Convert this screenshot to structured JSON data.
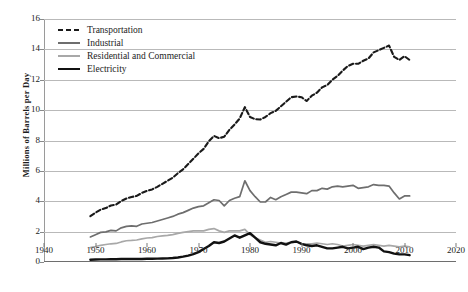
{
  "chart_data": {
    "type": "line",
    "title": "",
    "xlabel": "",
    "ylabel": "Millions of Barrels per Day",
    "xlim": [
      1940,
      2020
    ],
    "ylim": [
      0,
      16
    ],
    "xticks": [
      1940,
      1950,
      1960,
      1970,
      1980,
      1990,
      2000,
      2010,
      2020
    ],
    "yticks": [
      0,
      2,
      4,
      6,
      8,
      10,
      12,
      14,
      16
    ],
    "grid": "horizontal",
    "legend_position": "top-left",
    "x": [
      1949,
      1950,
      1951,
      1952,
      1953,
      1954,
      1955,
      1956,
      1957,
      1958,
      1959,
      1960,
      1961,
      1962,
      1963,
      1964,
      1965,
      1966,
      1967,
      1968,
      1969,
      1970,
      1971,
      1972,
      1973,
      1974,
      1975,
      1976,
      1977,
      1978,
      1979,
      1980,
      1981,
      1982,
      1983,
      1984,
      1985,
      1986,
      1987,
      1988,
      1989,
      1990,
      1991,
      1992,
      1993,
      1994,
      1995,
      1996,
      1997,
      1998,
      1999,
      2000,
      2001,
      2002,
      2003,
      2004,
      2005,
      2006,
      2007,
      2008,
      2009,
      2010,
      2011
    ],
    "series": [
      {
        "name": "Transportation",
        "style": "dashed",
        "color": "#1a1a1a",
        "width": 2.1,
        "values": [
          3.02,
          3.25,
          3.45,
          3.55,
          3.72,
          3.78,
          4.02,
          4.18,
          4.28,
          4.35,
          4.55,
          4.68,
          4.78,
          4.95,
          5.15,
          5.35,
          5.55,
          5.85,
          6.1,
          6.45,
          6.8,
          7.15,
          7.45,
          7.95,
          8.3,
          8.15,
          8.25,
          8.7,
          9.05,
          9.45,
          10.2,
          9.55,
          9.4,
          9.38,
          9.55,
          9.8,
          9.95,
          10.25,
          10.55,
          10.85,
          10.9,
          10.85,
          10.6,
          10.95,
          11.15,
          11.5,
          11.65,
          12.0,
          12.25,
          12.6,
          12.9,
          13.05,
          13.05,
          13.25,
          13.4,
          13.8,
          13.95,
          14.1,
          14.25,
          13.5,
          13.3,
          13.55,
          13.3
        ]
      },
      {
        "name": "Industrial",
        "style": "solid",
        "color": "#6e6e6e",
        "width": 1.7,
        "values": [
          1.65,
          1.8,
          1.95,
          1.98,
          2.08,
          2.05,
          2.25,
          2.35,
          2.38,
          2.35,
          2.5,
          2.55,
          2.6,
          2.7,
          2.8,
          2.9,
          3.0,
          3.15,
          3.25,
          3.4,
          3.55,
          3.65,
          3.7,
          3.9,
          4.1,
          4.05,
          3.7,
          4.05,
          4.2,
          4.3,
          5.35,
          4.7,
          4.3,
          3.95,
          3.95,
          4.25,
          4.1,
          4.3,
          4.45,
          4.6,
          4.6,
          4.55,
          4.5,
          4.7,
          4.7,
          4.85,
          4.8,
          4.95,
          5.0,
          4.95,
          5.0,
          5.05,
          4.85,
          4.9,
          4.95,
          5.1,
          5.05,
          5.05,
          5.0,
          4.55,
          4.15,
          4.35,
          4.35
        ]
      },
      {
        "name": "Residential and Commercial",
        "style": "solid",
        "color": "#a8a8a8",
        "width": 1.7,
        "values": [
          0.95,
          1.02,
          1.1,
          1.15,
          1.2,
          1.22,
          1.32,
          1.4,
          1.42,
          1.45,
          1.52,
          1.58,
          1.6,
          1.68,
          1.72,
          1.75,
          1.8,
          1.88,
          1.95,
          2.0,
          2.05,
          2.05,
          2.05,
          2.15,
          2.2,
          2.05,
          1.95,
          2.05,
          2.05,
          2.05,
          2.15,
          1.8,
          1.6,
          1.45,
          1.3,
          1.35,
          1.3,
          1.25,
          1.25,
          1.3,
          1.35,
          1.2,
          1.2,
          1.2,
          1.25,
          1.2,
          1.15,
          1.2,
          1.15,
          1.05,
          1.1,
          1.15,
          1.1,
          1.05,
          1.1,
          1.15,
          1.1,
          1.05,
          1.1,
          1.05,
          1.0,
          1.05,
          1.0
        ]
      },
      {
        "name": "Electricity",
        "style": "solid",
        "color": "#111111",
        "width": 2.4,
        "values": [
          0.15,
          0.16,
          0.17,
          0.17,
          0.18,
          0.18,
          0.2,
          0.2,
          0.2,
          0.2,
          0.2,
          0.21,
          0.21,
          0.22,
          0.23,
          0.24,
          0.26,
          0.3,
          0.35,
          0.42,
          0.52,
          0.65,
          0.85,
          1.05,
          1.3,
          1.25,
          1.35,
          1.55,
          1.75,
          1.6,
          1.75,
          1.9,
          1.6,
          1.3,
          1.2,
          1.15,
          1.1,
          1.25,
          1.15,
          1.3,
          1.35,
          1.2,
          1.1,
          1.05,
          1.1,
          1.0,
          0.9,
          0.9,
          0.95,
          1.0,
          0.9,
          0.95,
          1.0,
          0.85,
          0.95,
          1.0,
          0.95,
          0.7,
          0.65,
          0.55,
          0.5,
          0.5,
          0.45
        ]
      }
    ]
  },
  "caption": ""
}
